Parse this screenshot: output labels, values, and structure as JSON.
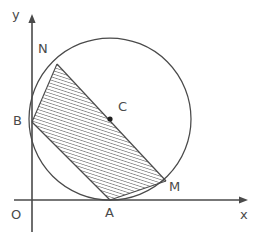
{
  "figure": {
    "background_color": "#ffffff",
    "stroke_color": "#4a4a4a",
    "hatch_color": "#5a5a5a",
    "label_color": "#4a4a4a"
  },
  "axes": {
    "origin_label": "O",
    "x_label": "x",
    "y_label": "y",
    "origin_px": {
      "x": 32,
      "y": 200
    },
    "x_axis_end_px": {
      "x": 248,
      "y": 200
    },
    "y_axis_end_px": {
      "x": 32,
      "y": 13
    }
  },
  "circle": {
    "center_label": "C",
    "center_px": {
      "x": 110,
      "y": 119
    },
    "radius_px": 81,
    "center_dot_radius_px": 2.6
  },
  "points": [
    {
      "name": "A",
      "label": "A",
      "px": {
        "x": 110,
        "y": 200
      },
      "label_px": {
        "x": 105,
        "y": 206
      },
      "description": "tangent point on x-axis"
    },
    {
      "name": "B",
      "label": "B",
      "px": {
        "x": 32,
        "y": 122
      },
      "label_px": {
        "x": 14,
        "y": 115
      },
      "description": "point on y-axis, band corner"
    },
    {
      "name": "C",
      "label": "C",
      "px": {
        "x": 110,
        "y": 119
      },
      "label_px": {
        "x": 117,
        "y": 100
      },
      "description": "circle center"
    },
    {
      "name": "M",
      "label": "M",
      "px": {
        "x": 165,
        "y": 180
      },
      "label_px": {
        "x": 168,
        "y": 180
      },
      "description": "band corner on circle lower right"
    },
    {
      "name": "N",
      "label": "N",
      "px": {
        "x": 57,
        "y": 64
      },
      "label_px": {
        "x": 38,
        "y": 42
      },
      "description": "band corner on circle upper left"
    }
  ],
  "band": {
    "description": "hatched parallelogram strip B-N-M-A inscribed in circle",
    "hatch_angle_deg": 72,
    "hatch_spacing_px": 3.2,
    "vertices": [
      {
        "name": "B",
        "x": 32,
        "y": 122
      },
      {
        "name": "N",
        "x": 57,
        "y": 64
      },
      {
        "name": "M",
        "x": 166,
        "y": 181
      },
      {
        "name": "A",
        "x": 110,
        "y": 200
      }
    ]
  }
}
